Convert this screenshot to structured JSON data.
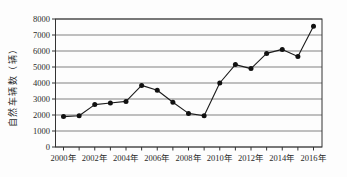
{
  "chart_data": {
    "type": "line",
    "title": "",
    "xlabel": "",
    "ylabel": "自然车辆数（辆）",
    "x": [
      2000,
      2001,
      2002,
      2003,
      2004,
      2005,
      2006,
      2007,
      2008,
      2009,
      2010,
      2011,
      2012,
      2013,
      2014,
      2015,
      2016
    ],
    "values": [
      1900,
      1950,
      2650,
      2750,
      2850,
      3850,
      3550,
      2800,
      2100,
      1950,
      4000,
      5150,
      4900,
      5850,
      6100,
      5650,
      7550
    ],
    "series_name": "自然车辆数",
    "ylim": [
      0,
      8000
    ],
    "ytick_step": 1000,
    "ytick_labels": [
      "0",
      "1000",
      "2000",
      "3000",
      "4000",
      "5000",
      "6000",
      "7000",
      "8000"
    ],
    "xtick_labels": [
      "2000年",
      "2002年",
      "2004年",
      "2006年",
      "2008年",
      "2010年",
      "2012年",
      "2014年",
      "2016年"
    ],
    "xtick_label_every": 2,
    "grid": "horizontal",
    "legend": "none",
    "marker": "filled-circle",
    "colors": {
      "line": "#1c1c1c",
      "marker": "#111111",
      "grid": "#4a4a4a",
      "frame": "#333333",
      "text": "#2a2a2a",
      "background": "#fdfdfd"
    }
  }
}
